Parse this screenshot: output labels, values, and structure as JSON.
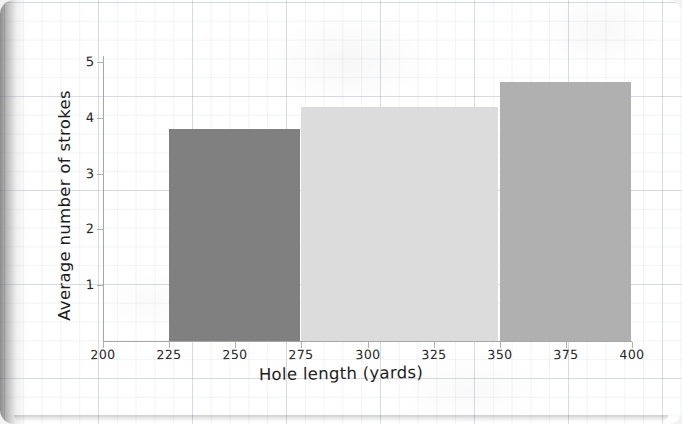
{
  "chart_data": {
    "type": "bar",
    "title": "",
    "xlabel": "Hole length (yards)",
    "ylabel": "Average number of strokes",
    "xlim": [
      200,
      400
    ],
    "ylim": [
      0,
      5
    ],
    "grid": true,
    "legend": "none",
    "xticks": [
      "200",
      "225",
      "250",
      "275",
      "300",
      "325",
      "350",
      "375",
      "400"
    ],
    "yticks": [
      "1",
      "2",
      "3",
      "4",
      "5"
    ],
    "bins": [
      {
        "label": "225-275",
        "x_start": 225,
        "x_end": 275,
        "value": 3.8,
        "color": "#808080"
      },
      {
        "label": "275-350",
        "x_start": 275,
        "x_end": 350,
        "value": 4.2,
        "color": "#dcdcdc"
      },
      {
        "label": "350-400",
        "x_start": 350,
        "x_end": 400,
        "value": 4.65,
        "color": "#b0b0b0"
      }
    ]
  },
  "page": {
    "background_color": "#ffffff",
    "grid_color": "#96a5b9",
    "axis_color": "#a6a6a6"
  }
}
